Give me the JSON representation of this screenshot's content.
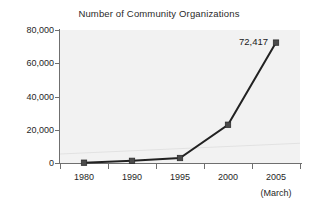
{
  "chart_data": {
    "type": "line",
    "title": "Number of Community Organizations",
    "xlabel": "",
    "ylabel": "",
    "categories": [
      "1980",
      "1990",
      "1995",
      "2000",
      "2005"
    ],
    "x_sublabel": "(March)",
    "x_sublabel_for": "2005",
    "values": [
      180,
      1300,
      3000,
      23000,
      72417
    ],
    "point_labels": [
      "",
      "",
      "",
      "",
      "72,417"
    ],
    "ylim": [
      0,
      80000
    ],
    "y_ticks": [
      0,
      20000,
      40000,
      60000,
      80000
    ],
    "y_tick_labels": [
      "0",
      "20,000",
      "40,000",
      "60,000",
      "80,000"
    ],
    "grid": false,
    "legend": false,
    "marker": "square",
    "colors": {
      "line": "#222222",
      "marker": "#4a4a4a",
      "plot_background": "#f2f2f2",
      "axis": "#6f6f6f",
      "text": "#1a1a1a",
      "page_background": "#ffffff"
    }
  },
  "annotations": {
    "last_point_label": "72,417"
  }
}
